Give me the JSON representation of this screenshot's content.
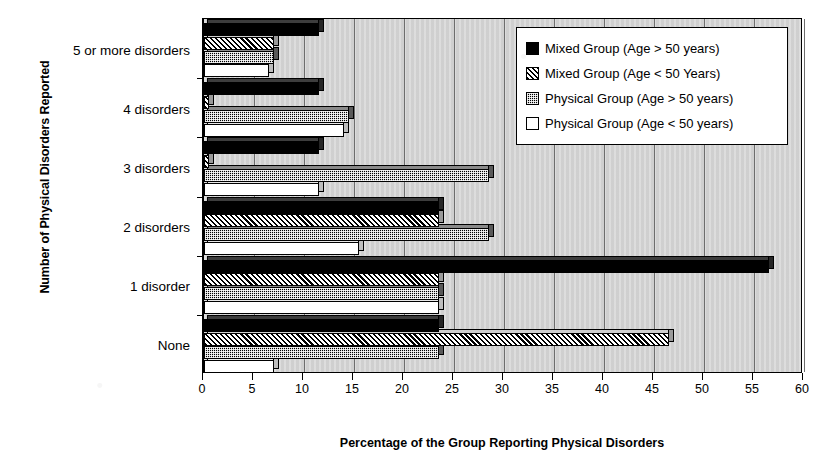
{
  "chart_data": {
    "type": "bar",
    "orientation": "horizontal",
    "title": "",
    "xlabel": "Percentage of the Group Reporting Physical Disorders",
    "ylabel": "Number of Physical Disorders Reported",
    "xlim": [
      0,
      60
    ],
    "xticks": [
      0,
      5,
      10,
      15,
      20,
      25,
      30,
      35,
      40,
      45,
      50,
      55,
      60
    ],
    "xtick_labels": [
      "0",
      "5",
      "10",
      "15",
      "20",
      "25",
      "30",
      "35",
      "40",
      "45",
      "50",
      "55",
      "60"
    ],
    "grid": true,
    "legend_position": "top-right",
    "categories": [
      "5 or more disorders",
      "4 disorders",
      "3 disorders",
      "2 disorders",
      "1 disorder",
      "None"
    ],
    "series": [
      {
        "name": "Mixed Group (Age > 50 years)",
        "fill": "solid-black",
        "values": [
          11.5,
          11.5,
          11.5,
          23.5,
          56.5,
          23.5
        ]
      },
      {
        "name": "Mixed Group (Age < 50 Years)",
        "fill": "diagonal-hatch",
        "values": [
          7.0,
          0.5,
          0.5,
          23.5,
          23.5,
          46.5
        ]
      },
      {
        "name": "Physical Group (Age > 50 years)",
        "fill": "dotted-dark",
        "values": [
          7.0,
          14.5,
          28.5,
          28.5,
          23.5,
          23.5
        ]
      },
      {
        "name": "Physical Group (Age < 50 years)",
        "fill": "white",
        "values": [
          6.5,
          14.0,
          11.5,
          15.5,
          23.5,
          7.0
        ]
      }
    ]
  },
  "legend": {
    "entries": [
      "Mixed Group (Age > 50 years)",
      "Mixed Group (Age < 50 Years)",
      "Physical Group (Age > 50 years)",
      "Physical Group (Age < 50 years)"
    ]
  },
  "colors": {
    "plot_background": "#d6d6d6",
    "axis": "#000000",
    "gridline": "#6d6d6d",
    "series_solid": "#000000",
    "series_white": "#ffffff"
  }
}
